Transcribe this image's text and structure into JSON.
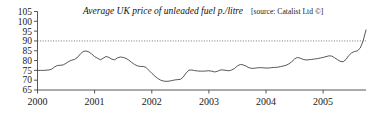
{
  "chart_data": {
    "type": "line",
    "title": "Average UK price of unleaded fuel p./litre",
    "source": "[source: Catalist Ltd ©]",
    "xlabel": "",
    "ylabel": "",
    "ylim": [
      65,
      105
    ],
    "xlim": [
      2000,
      2005.75
    ],
    "grid": false,
    "legend_position": "none",
    "y_ticks": [
      65,
      70,
      75,
      80,
      85,
      90,
      95,
      100,
      105
    ],
    "x_ticks": [
      2000,
      2001,
      2002,
      2003,
      2004,
      2005
    ],
    "x_tick_labels": [
      "2000",
      "2001",
      "2002",
      "2003",
      "2004",
      "2005"
    ],
    "reference_line": {
      "value": 90,
      "style": "dotted"
    },
    "series": [
      {
        "name": "Average UK unleaded fuel price (p./litre)",
        "x": [
          2000.0,
          2000.05,
          2000.1,
          2000.15,
          2000.2,
          2000.25,
          2000.3,
          2000.35,
          2000.4,
          2000.45,
          2000.5,
          2000.55,
          2000.6,
          2000.65,
          2000.7,
          2000.75,
          2000.8,
          2000.85,
          2000.9,
          2000.95,
          2001.0,
          2001.05,
          2001.1,
          2001.15,
          2001.2,
          2001.25,
          2001.3,
          2001.35,
          2001.4,
          2001.45,
          2001.5,
          2001.55,
          2001.6,
          2001.65,
          2001.7,
          2001.75,
          2001.8,
          2001.85,
          2001.9,
          2001.95,
          2002.0,
          2002.05,
          2002.1,
          2002.15,
          2002.2,
          2002.25,
          2002.3,
          2002.35,
          2002.4,
          2002.45,
          2002.5,
          2002.55,
          2002.6,
          2002.65,
          2002.7,
          2002.75,
          2002.8,
          2002.85,
          2002.9,
          2002.95,
          2003.0,
          2003.05,
          2003.1,
          2003.15,
          2003.2,
          2003.25,
          2003.3,
          2003.35,
          2003.4,
          2003.45,
          2003.5,
          2003.55,
          2003.6,
          2003.65,
          2003.7,
          2003.75,
          2003.8,
          2003.85,
          2003.9,
          2003.95,
          2004.0,
          2004.05,
          2004.1,
          2004.15,
          2004.2,
          2004.25,
          2004.3,
          2004.35,
          2004.4,
          2004.45,
          2004.5,
          2004.55,
          2004.6,
          2004.65,
          2004.7,
          2004.75,
          2004.8,
          2004.85,
          2004.9,
          2004.95,
          2005.0,
          2005.05,
          2005.1,
          2005.15,
          2005.2,
          2005.25,
          2005.3,
          2005.35,
          2005.4,
          2005.45,
          2005.5,
          2005.55,
          2005.6,
          2005.65,
          2005.7,
          2005.75
        ],
        "values": [
          75.0,
          75.0,
          75.0,
          75.1,
          75.2,
          75.6,
          76.8,
          77.5,
          77.6,
          77.8,
          78.6,
          79.6,
          80.2,
          80.6,
          81.6,
          83.4,
          84.6,
          84.9,
          84.4,
          83.3,
          82.0,
          81.2,
          80.4,
          81.2,
          82.1,
          81.6,
          80.7,
          80.4,
          81.4,
          81.8,
          81.6,
          81.1,
          80.2,
          79.0,
          78.0,
          77.3,
          77.0,
          77.0,
          76.5,
          75.0,
          73.5,
          72.2,
          71.0,
          70.1,
          69.6,
          69.4,
          69.5,
          69.8,
          70.1,
          70.3,
          70.4,
          71.6,
          73.6,
          75.1,
          75.2,
          74.9,
          74.7,
          74.6,
          74.6,
          74.7,
          74.8,
          74.6,
          74.2,
          74.5,
          75.2,
          75.2,
          75.0,
          74.8,
          75.2,
          76.0,
          77.3,
          78.0,
          77.8,
          77.2,
          76.4,
          76.0,
          76.1,
          76.3,
          76.4,
          76.3,
          76.2,
          76.2,
          76.4,
          76.5,
          76.6,
          76.9,
          77.2,
          77.6,
          78.3,
          79.4,
          80.8,
          81.6,
          81.2,
          80.6,
          80.3,
          80.4,
          80.6,
          80.8,
          81.0,
          81.3,
          81.6,
          82.0,
          82.4,
          82.3,
          81.4,
          80.5,
          79.6,
          79.4,
          80.6,
          82.6,
          84.0,
          84.6,
          85.0,
          86.4,
          90.0,
          95.6
        ]
      }
    ]
  },
  "axis": {
    "y_tick_labels": [
      "105",
      "100",
      "95",
      "90",
      "85",
      "80",
      "75",
      "70",
      "65"
    ],
    "x_tick_labels": [
      "2000",
      "2001",
      "2002",
      "2003",
      "2004",
      "2005"
    ]
  }
}
